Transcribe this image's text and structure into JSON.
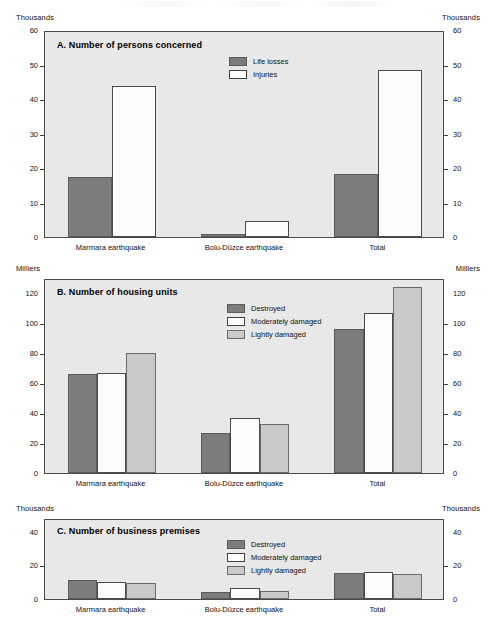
{
  "figure": {
    "categories": [
      "Marmara earthquake",
      "Bolu-Düzce earthquake",
      "Total"
    ],
    "colors": {
      "plot_background": "#e8e8e8",
      "series_dark": "#7c7c7c",
      "series_white": "#ffffff",
      "series_light": "#c9c9c9",
      "frame": "#4a4a4a"
    }
  },
  "panels": [
    {
      "id": "A",
      "title": "A.  Number of persons concerned",
      "unit_left": "Thousands",
      "unit_right": "Thousands",
      "yticks": [
        "0",
        "10",
        "20",
        "30",
        "40",
        "50",
        "60"
      ]
    },
    {
      "id": "B",
      "title": "B.  Number of housing units",
      "unit_left": "Milliers",
      "unit_right": "Milliers",
      "yticks": [
        "0",
        "20",
        "40",
        "60",
        "80",
        "100",
        "120"
      ]
    },
    {
      "id": "C",
      "title": "C.  Number of business premises",
      "unit_left": "Thousands",
      "unit_right": "Thousands",
      "yticks": [
        "0",
        "20",
        "40"
      ]
    }
  ],
  "chart_data": [
    {
      "type": "bar",
      "panel": "A",
      "title": "A.  Number of persons concerned",
      "xlabel": "",
      "ylabel": "Thousands",
      "ylim": [
        0,
        60
      ],
      "yticks": [
        0,
        10,
        20,
        30,
        40,
        50,
        60
      ],
      "grid": false,
      "legend_position": "top-center",
      "categories": [
        "Marmara earthquake",
        "Bolu-Düzce earthquake",
        "Total"
      ],
      "series": [
        {
          "name": "Life losses",
          "color": "#7c7c7c",
          "values": [
            17.4,
            0.8,
            18.2
          ]
        },
        {
          "name": "Injuries",
          "color": "#ffffff",
          "values": [
            43.9,
            4.5,
            48.4
          ]
        }
      ]
    },
    {
      "type": "bar",
      "panel": "B",
      "title": "B.  Number of housing units",
      "xlabel": "",
      "ylabel": "Milliers",
      "ylim": [
        0,
        130
      ],
      "yticks": [
        0,
        20,
        40,
        60,
        80,
        100,
        120
      ],
      "grid": false,
      "legend_position": "top-center",
      "categories": [
        "Marmara earthquake",
        "Bolu-Düzce earthquake",
        "Total"
      ],
      "series": [
        {
          "name": "Destroyed",
          "color": "#7c7c7c",
          "values": [
            66,
            27,
            96
          ]
        },
        {
          "name": "Moderately damaged",
          "color": "#ffffff",
          "values": [
            67,
            37,
            107
          ]
        },
        {
          "name": "Lightly damaged",
          "color": "#c9c9c9",
          "values": [
            80,
            33,
            124
          ]
        }
      ]
    },
    {
      "type": "bar",
      "panel": "C",
      "title": "C.  Number of business premises",
      "xlabel": "",
      "ylabel": "Thousands",
      "ylim": [
        0,
        48
      ],
      "yticks": [
        0,
        20,
        40
      ],
      "grid": false,
      "legend_position": "top-center",
      "categories": [
        "Marmara earthquake",
        "Bolu-Düzce earthquake",
        "Total"
      ],
      "series": [
        {
          "name": "Destroyed",
          "color": "#7c7c7c",
          "values": [
            11,
            4,
            15.5
          ]
        },
        {
          "name": "Moderately damaged",
          "color": "#ffffff",
          "values": [
            10,
            6.5,
            16
          ]
        },
        {
          "name": "Lightly damaged",
          "color": "#c9c9c9",
          "values": [
            9.5,
            4.5,
            15
          ]
        }
      ]
    }
  ]
}
